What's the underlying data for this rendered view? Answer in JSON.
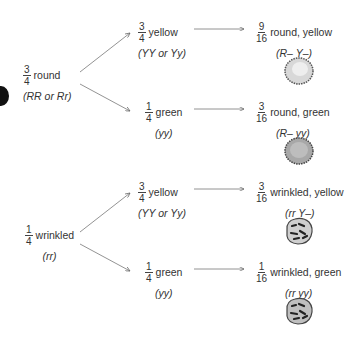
{
  "diagram": {
    "level1": [
      {
        "num": "3",
        "den": "4",
        "label": "round",
        "genotype": "(RR or Rr)"
      },
      {
        "num": "1",
        "den": "4",
        "label": "wrinkled",
        "genotype": "(rr)"
      }
    ],
    "level2": [
      {
        "num": "3",
        "den": "4",
        "label": "yellow",
        "genotype": "(YY or Yy)"
      },
      {
        "num": "1",
        "den": "4",
        "label": "green",
        "genotype": "(yy)"
      },
      {
        "num": "3",
        "den": "4",
        "label": "yellow",
        "genotype": "(YY or Yy)"
      },
      {
        "num": "1",
        "den": "4",
        "label": "green",
        "genotype": "(yy)"
      }
    ],
    "level3": [
      {
        "num": "9",
        "den": "16",
        "label": "round, yellow",
        "genotype": "(R– Y–)",
        "pea": "round-smooth-pea"
      },
      {
        "num": "3",
        "den": "16",
        "label": "round, green",
        "genotype": "(R– yy)",
        "pea": "round-dark-pea"
      },
      {
        "num": "3",
        "den": "16",
        "label": "wrinkled, yellow",
        "genotype": "(rr Y–)",
        "pea": "wrinkled-pea"
      },
      {
        "num": "1",
        "den": "16",
        "label": "wrinkled, green",
        "genotype": "(rr yy)",
        "pea": "wrinkled-pea"
      }
    ],
    "colors": {
      "text": "#333333",
      "arrow": "#666666",
      "background": "#ffffff"
    }
  }
}
